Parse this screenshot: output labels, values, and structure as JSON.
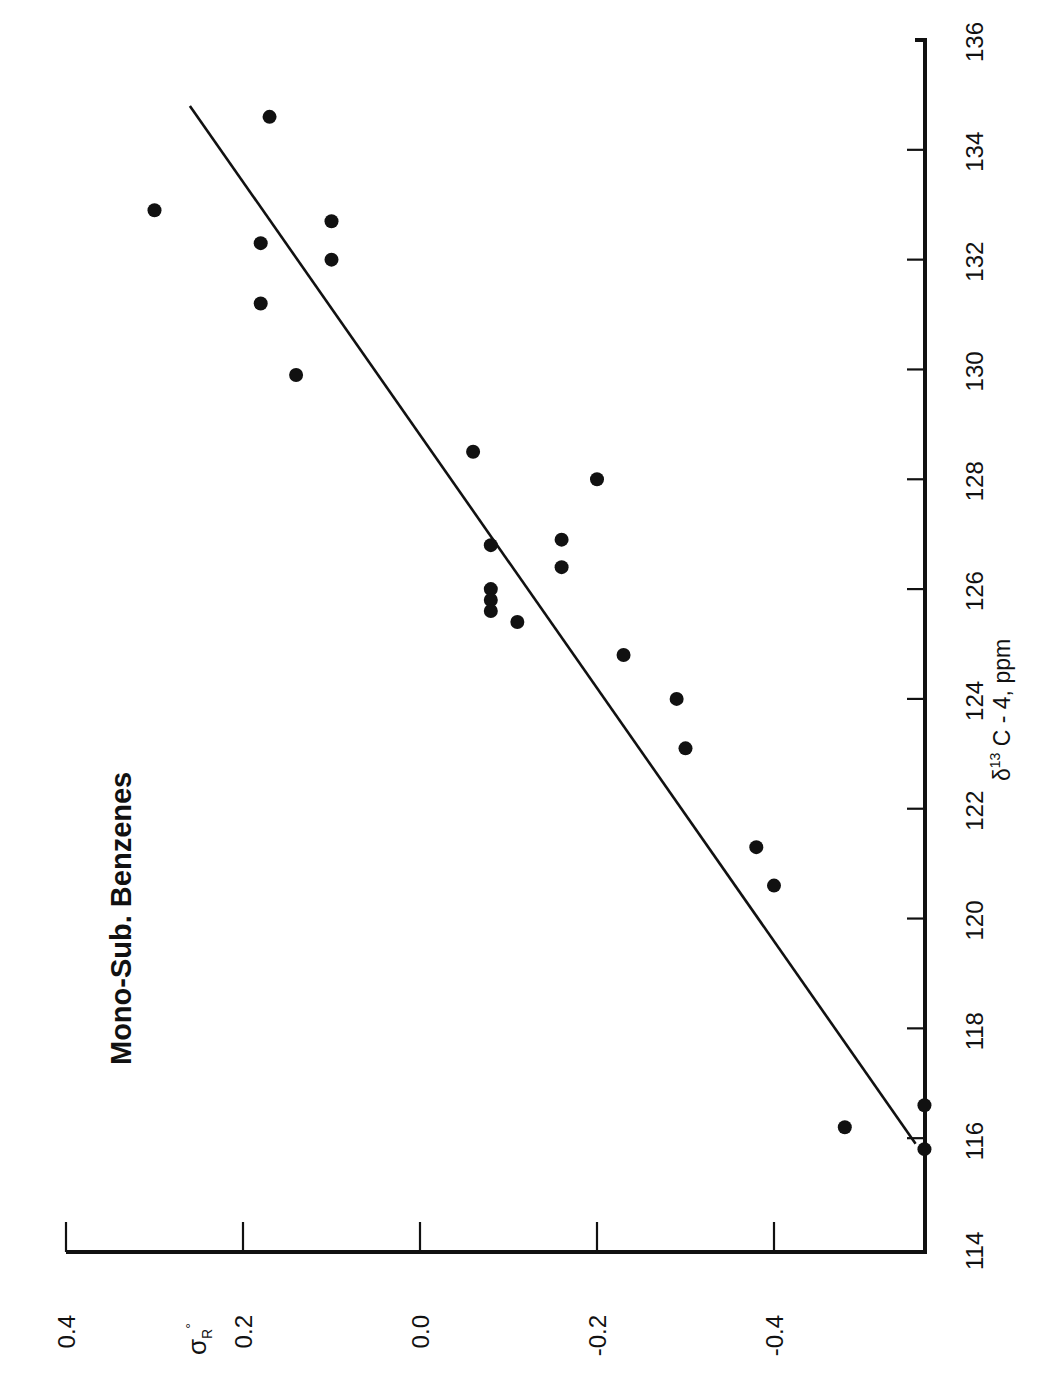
{
  "chart_data": {
    "type": "scatter",
    "title": "Mono-Sub. Benzenes",
    "xlabel": "δ13 C - 4, ppm",
    "xlabel_parts": {
      "delta": "δ",
      "sup": "13",
      "rest": " C - 4, ppm"
    },
    "ylabel": "σR°",
    "ylabel_parts": {
      "sigma": "σ",
      "sub": "R",
      "sup": "°"
    },
    "orientation": "rotated 90° counter-clockwise (x-axis vertical on right, y-axis horizontal at bottom)",
    "xlim": [
      114,
      136
    ],
    "ylim": [
      -0.58,
      0.4
    ],
    "x_ticks": [
      114,
      116,
      118,
      120,
      122,
      124,
      126,
      128,
      130,
      132,
      134,
      136
    ],
    "y_ticks": [
      0.4,
      0.2,
      0.0,
      -0.2,
      -0.4
    ],
    "y_tick_labels": [
      "0.4",
      "0.2",
      "0.0",
      "-0.2",
      "-0.4"
    ],
    "grid": false,
    "legend": null,
    "series": [
      {
        "name": "Mono-substituted benzenes",
        "marker": "filled-circle",
        "points": [
          {
            "x": 132.9,
            "y": 0.3
          },
          {
            "x": 134.6,
            "y": 0.17
          },
          {
            "x": 132.3,
            "y": 0.18
          },
          {
            "x": 132.7,
            "y": 0.1
          },
          {
            "x": 132.0,
            "y": 0.1
          },
          {
            "x": 131.2,
            "y": 0.18
          },
          {
            "x": 129.9,
            "y": 0.14
          },
          {
            "x": 128.5,
            "y": -0.06
          },
          {
            "x": 128.0,
            "y": -0.2
          },
          {
            "x": 126.8,
            "y": -0.08
          },
          {
            "x": 126.9,
            "y": -0.16
          },
          {
            "x": 126.4,
            "y": -0.16
          },
          {
            "x": 126.0,
            "y": -0.08
          },
          {
            "x": 125.8,
            "y": -0.08
          },
          {
            "x": 125.6,
            "y": -0.08
          },
          {
            "x": 125.4,
            "y": -0.11
          },
          {
            "x": 124.8,
            "y": -0.23
          },
          {
            "x": 124.0,
            "y": -0.29
          },
          {
            "x": 123.1,
            "y": -0.3
          },
          {
            "x": 121.3,
            "y": -0.38
          },
          {
            "x": 120.6,
            "y": -0.4
          },
          {
            "x": 116.2,
            "y": -0.48
          },
          {
            "x": 116.6,
            "y": -0.57
          },
          {
            "x": 115.8,
            "y": -0.57
          }
        ]
      }
    ],
    "fit_line": {
      "x": [
        115.9,
        134.8
      ],
      "y": [
        -0.56,
        0.26
      ]
    }
  },
  "layout": {
    "x_axis_px": {
      "v114": 1248,
      "v136": 40,
      "axis_x": 925
    },
    "y_axis_px": {
      "v0_4": 66,
      "v_neg0_4": 774,
      "axis_y": 1252
    }
  }
}
